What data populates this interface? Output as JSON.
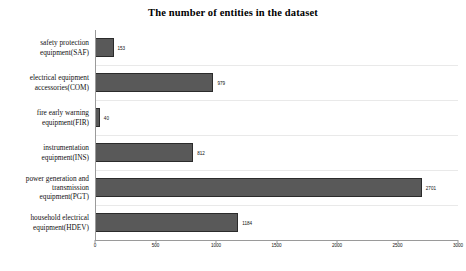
{
  "chart_data": {
    "type": "bar",
    "orientation": "horizontal",
    "title": "The number of entities in the dataset",
    "xlabel": "",
    "ylabel": "",
    "categories": [
      "safety protection equipment(SAF)",
      "electrical equipment accessories(COM)",
      "fire early warning equipment(FIR)",
      "instrumentation equipment(INS)",
      "power generation and transmission equipment(PGT)",
      "household electrical equipment(HDEV)"
    ],
    "category_lines": [
      [
        "safety protection",
        "equipment(SAF)"
      ],
      [
        "electrical equipment",
        "accessories(COM)"
      ],
      [
        "fire early warning",
        "equipment(FIR)"
      ],
      [
        "instrumentation",
        "equipment(INS)"
      ],
      [
        "power generation and",
        "transmission",
        "equipment(PGT)"
      ],
      [
        "household electrical",
        "equipment(HDEV)"
      ]
    ],
    "values": [
      153,
      979,
      40,
      812,
      2701,
      1184
    ],
    "value_labels": [
      "153",
      "979",
      "40",
      "812",
      "2701",
      "1184"
    ],
    "xlim": [
      0,
      3000
    ],
    "xticks": [
      0,
      500,
      1000,
      1500,
      2000,
      2500,
      3000
    ],
    "xtick_labels": [
      "0",
      "500",
      "1000",
      "1500",
      "2000",
      "2500",
      "3000"
    ],
    "grid": true,
    "legend": null,
    "colors": {
      "bar_fill": "#595959",
      "bar_edge": "#2b2b2b",
      "grid": "#e9e9e9",
      "axis": "#9a9a9a",
      "text": "#111111",
      "background": "#ffffff"
    }
  }
}
